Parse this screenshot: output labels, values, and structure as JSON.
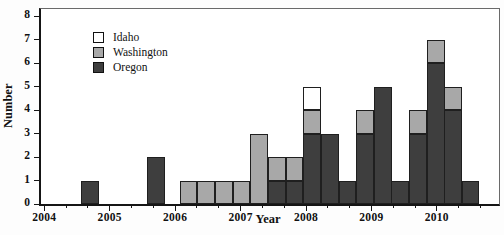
{
  "chart_data": {
    "type": "bar",
    "stacked": true,
    "title": "",
    "xlabel": "Year",
    "ylabel": "Number",
    "xlim": [
      2003.95,
      2010.95
    ],
    "ylim": [
      0,
      8
    ],
    "x_major_ticks": [
      2004,
      2005,
      2006,
      2007,
      2008,
      2009,
      2010
    ],
    "x_minor_ticks_per_year": 3,
    "y_ticks": [
      0,
      1,
      2,
      3,
      4,
      5,
      6,
      7,
      8
    ],
    "bar_width_years": 0.27,
    "stack_order": [
      "oregon",
      "washington",
      "idaho"
    ],
    "legend": {
      "position": "upper-left",
      "entries": [
        {
          "key": "idaho",
          "label": "Idaho",
          "color": "#ffffff"
        },
        {
          "key": "washington",
          "label": "Washington",
          "color": "#a8a8a8"
        },
        {
          "key": "oregon",
          "label": "Oregon",
          "color": "#3e3e3e"
        }
      ]
    },
    "bars": [
      {
        "x_start": 2004.56,
        "oregon": 1,
        "washington": 0,
        "idaho": 0
      },
      {
        "x_start": 2005.57,
        "oregon": 2,
        "washington": 0,
        "idaho": 0
      },
      {
        "x_start": 2006.07,
        "oregon": 0,
        "washington": 1,
        "idaho": 0
      },
      {
        "x_start": 2006.34,
        "oregon": 0,
        "washington": 1,
        "idaho": 0
      },
      {
        "x_start": 2006.61,
        "oregon": 0,
        "washington": 1,
        "idaho": 0
      },
      {
        "x_start": 2006.88,
        "oregon": 0,
        "washington": 1,
        "idaho": 0
      },
      {
        "x_start": 2007.15,
        "oregon": 0,
        "washington": 3,
        "idaho": 0
      },
      {
        "x_start": 2007.42,
        "oregon": 1,
        "washington": 1,
        "idaho": 0
      },
      {
        "x_start": 2007.69,
        "oregon": 1,
        "washington": 1,
        "idaho": 0
      },
      {
        "x_start": 2007.96,
        "oregon": 3,
        "washington": 1,
        "idaho": 1
      },
      {
        "x_start": 2008.23,
        "oregon": 3,
        "washington": 0,
        "idaho": 0
      },
      {
        "x_start": 2008.5,
        "oregon": 1,
        "washington": 0,
        "idaho": 0
      },
      {
        "x_start": 2008.77,
        "oregon": 3,
        "washington": 1,
        "idaho": 0
      },
      {
        "x_start": 2009.04,
        "oregon": 5,
        "washington": 0,
        "idaho": 0
      },
      {
        "x_start": 2009.3,
        "oregon": 1,
        "washington": 0,
        "idaho": 0
      },
      {
        "x_start": 2009.58,
        "oregon": 3,
        "washington": 1,
        "idaho": 0
      },
      {
        "x_start": 2009.85,
        "oregon": 6,
        "washington": 1,
        "idaho": 0
      },
      {
        "x_start": 2010.11,
        "oregon": 4,
        "washington": 1,
        "idaho": 0
      },
      {
        "x_start": 2010.38,
        "oregon": 1,
        "washington": 0,
        "idaho": 0
      }
    ],
    "colors": {
      "outline": "#1f1f1f",
      "axis": "#151515",
      "frame": "#6a6a6a",
      "background": "#ffffff"
    }
  }
}
